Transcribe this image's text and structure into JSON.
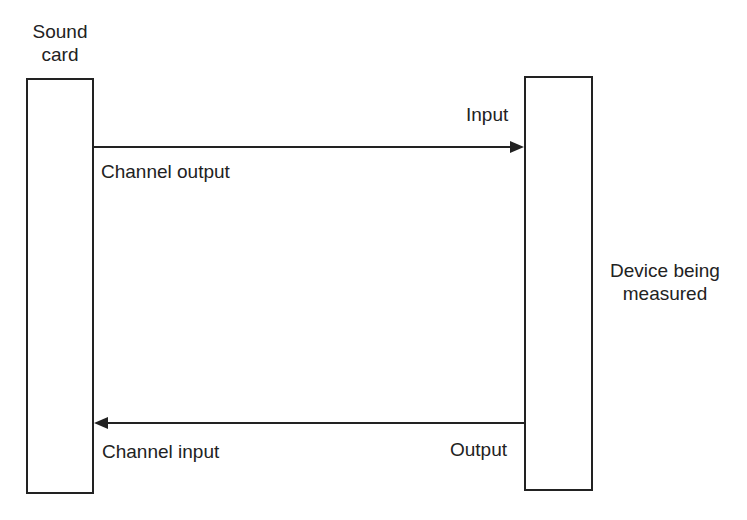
{
  "diagram": {
    "left_block": {
      "label_line1": "Sound",
      "label_line2": "card"
    },
    "right_block": {
      "label_line1": "Device being",
      "label_line2": "measured"
    },
    "top_connection": {
      "from_label": "Channel output",
      "to_label": "Input",
      "direction": "left-to-right"
    },
    "bottom_connection": {
      "from_label": "Output",
      "to_label": "Channel input",
      "direction": "right-to-left"
    },
    "colors": {
      "stroke": "#222222",
      "background": "#ffffff"
    }
  }
}
